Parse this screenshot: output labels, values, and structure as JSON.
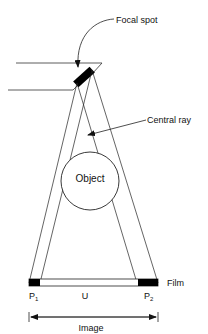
{
  "diagram": {
    "type": "radiography-geometry",
    "colors": {
      "line": "#1a1a1a",
      "fill": "#000000",
      "background": "#ffffff"
    },
    "labels": {
      "focal_spot": "Focal spot",
      "central_ray": "Central ray",
      "object": "Object",
      "film": "Film",
      "p1": "P",
      "p1_sub": "1",
      "umbra": "U",
      "p2": "P",
      "p2_sub": "2",
      "image": "Image"
    }
  }
}
